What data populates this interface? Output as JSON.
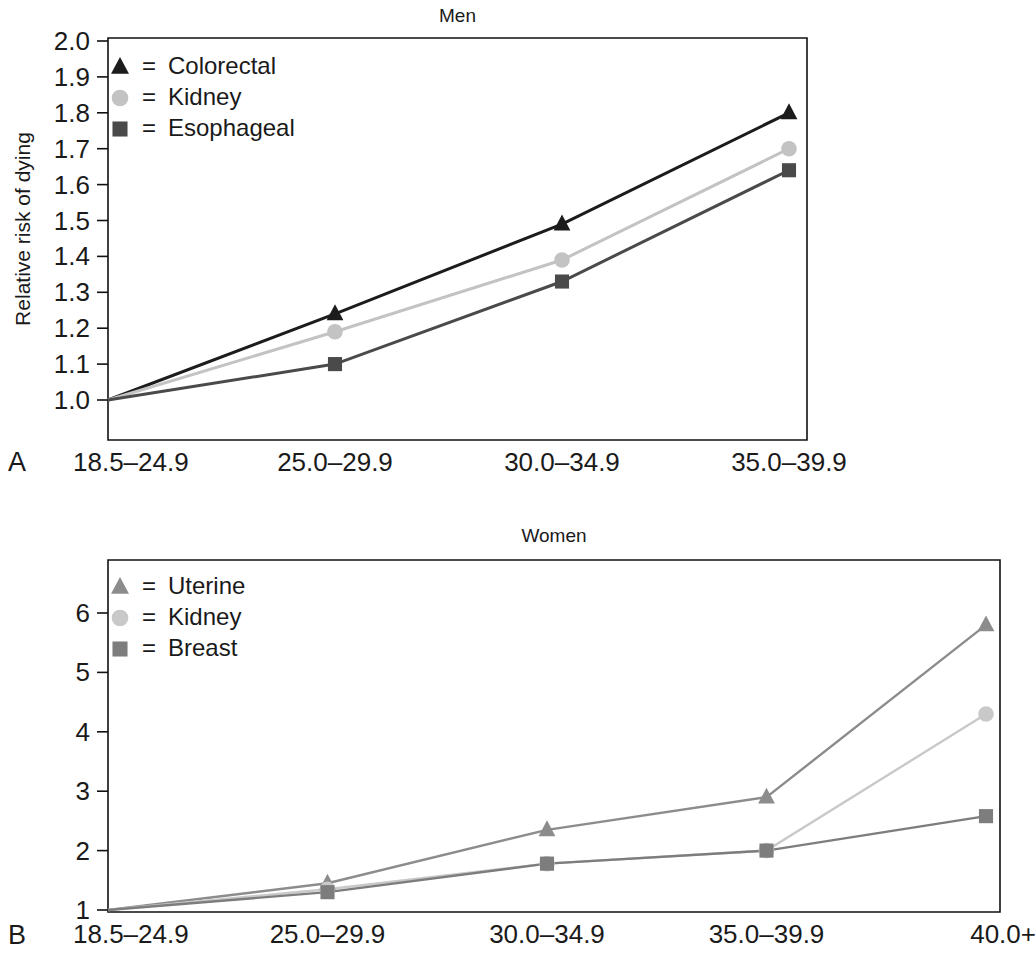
{
  "figure": {
    "panels": [
      {
        "letter": "A",
        "title": "Men",
        "ylabel": "Relative risk of dying",
        "categories": [
          "18.5–24.9",
          "25.0–29.9",
          "30.0–34.9",
          "35.0–39.9"
        ],
        "yticks": [
          "1.0",
          "1.1",
          "1.2",
          "1.3",
          "1.4",
          "1.5",
          "1.6",
          "1.7",
          "1.8",
          "1.9",
          "2.0"
        ],
        "legend": [
          {
            "label": "Colorectal",
            "eq": "=",
            "marker": "triangle",
            "color": "#1c1c1c"
          },
          {
            "label": "Kidney",
            "eq": "=",
            "marker": "circle",
            "color": "#c3c3c3"
          },
          {
            "label": "Esophageal",
            "eq": "=",
            "marker": "square",
            "color": "#4a4a4a"
          }
        ]
      },
      {
        "letter": "B",
        "title": "Women",
        "ylabel": "",
        "categories": [
          "18.5–24.9",
          "25.0–29.9",
          "30.0–34.9",
          "35.0–39.9",
          "40.0+"
        ],
        "yticks": [
          "1",
          "2",
          "3",
          "4",
          "5",
          "6"
        ],
        "legend": [
          {
            "label": "Uterine",
            "eq": "=",
            "marker": "triangle",
            "color": "#8c8c8c"
          },
          {
            "label": "Kidney",
            "eq": "=",
            "marker": "circle",
            "color": "#c9c9c9"
          },
          {
            "label": "Breast",
            "eq": "=",
            "marker": "square",
            "color": "#7d7d7d"
          }
        ]
      }
    ]
  },
  "chart_data": [
    {
      "type": "line",
      "title": "Men",
      "panel": "A",
      "xlabel": "",
      "ylabel": "Relative risk of dying",
      "categories": [
        "18.5–24.9",
        "25.0–29.9",
        "30.0–34.9",
        "35.0–39.9"
      ],
      "ylim": [
        0.93,
        2.0
      ],
      "yticks": [
        1.0,
        1.1,
        1.2,
        1.3,
        1.4,
        1.5,
        1.6,
        1.7,
        1.8,
        1.9,
        2.0
      ],
      "grid": false,
      "legend_position": "top-left inside plot",
      "series": [
        {
          "name": "Colorectal",
          "marker": "triangle",
          "color": "#1c1c1c",
          "values": [
            1.0,
            1.24,
            1.49,
            1.8
          ]
        },
        {
          "name": "Kidney",
          "marker": "circle",
          "color": "#c3c3c3",
          "values": [
            1.0,
            1.19,
            1.39,
            1.7
          ]
        },
        {
          "name": "Esophageal",
          "marker": "square",
          "color": "#4a4a4a",
          "values": [
            1.0,
            1.1,
            1.33,
            1.64
          ]
        }
      ]
    },
    {
      "type": "line",
      "title": "Women",
      "panel": "B",
      "xlabel": "",
      "ylabel": "",
      "categories": [
        "18.5–24.9",
        "25.0–29.9",
        "30.0–34.9",
        "35.0–39.9",
        "40.0+"
      ],
      "ylim": [
        1.0,
        6.55
      ],
      "yticks": [
        1,
        2,
        3,
        4,
        5,
        6
      ],
      "grid": false,
      "legend_position": "top-left inside plot",
      "series": [
        {
          "name": "Uterine",
          "marker": "triangle",
          "color": "#8c8c8c",
          "values": [
            1.0,
            1.45,
            2.35,
            2.9,
            5.8
          ]
        },
        {
          "name": "Kidney",
          "marker": "circle",
          "color": "#c9c9c9",
          "values": [
            1.0,
            1.35,
            1.78,
            2.0,
            4.3
          ]
        },
        {
          "name": "Breast",
          "marker": "square",
          "color": "#7d7d7d",
          "values": [
            1.0,
            1.3,
            1.78,
            2.0,
            2.58
          ]
        }
      ]
    }
  ]
}
